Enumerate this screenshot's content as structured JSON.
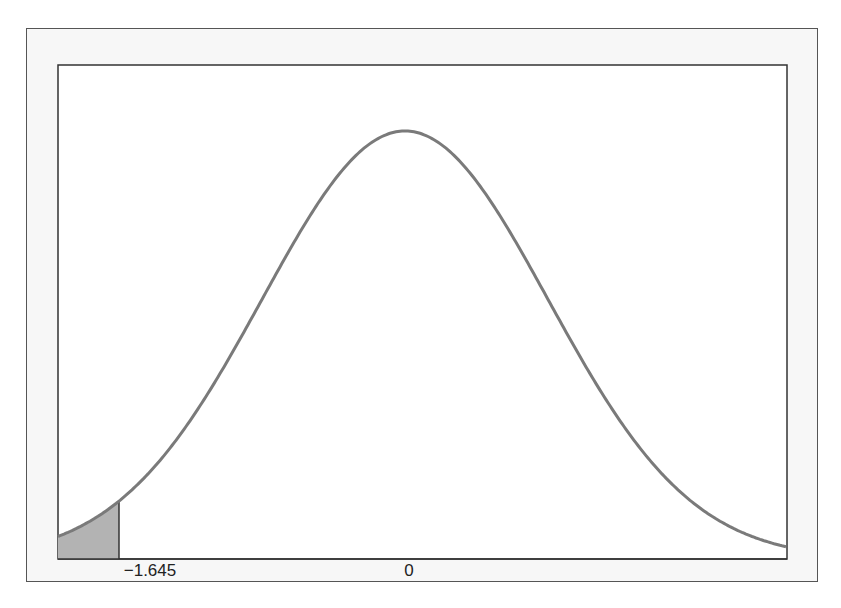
{
  "chart_data": {
    "type": "area",
    "title": "",
    "xlabel": "",
    "ylabel": "",
    "distribution": {
      "name": "standard normal",
      "mean": 0,
      "sd": 1
    },
    "x_ticks": [
      {
        "value": -1.645,
        "label": "−1.645"
      },
      {
        "value": 0,
        "label": "0"
      }
    ],
    "shaded_region": {
      "from": "-inf",
      "to": -1.645,
      "area": 0.05,
      "color": "#b3b3b3"
    },
    "curve_color": "#7a7a7a",
    "grid": false,
    "legend": null
  },
  "labels": {
    "critical_value": "−1.645",
    "mean": "0"
  }
}
